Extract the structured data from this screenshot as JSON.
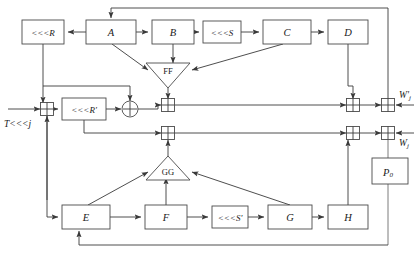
{
  "diagram": {
    "type": "block-diagram",
    "width": 420,
    "height": 255,
    "background_color": "#ffffff",
    "line_color": "#3a3a3a",
    "box_fill": "#ffffff",
    "box_stroke": "#4a4a4a",
    "text_color": "#1a1a1a"
  },
  "boxes": {
    "rot_r": {
      "label": "<<<R",
      "x": 22,
      "y": 20,
      "w": 42,
      "h": 24
    },
    "a": {
      "label": "A",
      "x": 86,
      "y": 20,
      "w": 50,
      "h": 24
    },
    "b": {
      "label": "B",
      "x": 152,
      "y": 20,
      "w": 42,
      "h": 24
    },
    "rot_s": {
      "label": "<<<S",
      "x": 203,
      "y": 20,
      "w": 38,
      "h": 22
    },
    "c": {
      "label": "C",
      "x": 263,
      "y": 20,
      "w": 48,
      "h": 24
    },
    "d": {
      "label": "D",
      "x": 328,
      "y": 20,
      "w": 40,
      "h": 24
    },
    "rot_rp": {
      "label": "<<<R'",
      "x": 62,
      "y": 98,
      "w": 44,
      "h": 22
    },
    "e": {
      "label": "E",
      "x": 62,
      "y": 205,
      "w": 48,
      "h": 24
    },
    "f": {
      "label": "F",
      "x": 145,
      "y": 205,
      "w": 42,
      "h": 24
    },
    "rot_sp": {
      "label": "<<<S'",
      "x": 212,
      "y": 206,
      "w": 36,
      "h": 22
    },
    "g": {
      "label": "G",
      "x": 268,
      "y": 205,
      "w": 44,
      "h": 24
    },
    "h": {
      "label": "H",
      "x": 328,
      "y": 205,
      "w": 40,
      "h": 24
    },
    "p0": {
      "label": "P",
      "sublabel": "0",
      "x": 372,
      "y": 158,
      "w": 36,
      "h": 26
    }
  },
  "triangles": {
    "ff": {
      "label": "FF",
      "cx": 168,
      "cy": 74,
      "half_width": 22,
      "height": 24,
      "orientation": "down"
    },
    "gg": {
      "label": "GG",
      "cx": 168,
      "cy": 168,
      "half_width": 22,
      "height": 24,
      "orientation": "up"
    }
  },
  "xor_boxes": [
    {
      "name": "xor-input",
      "cx": 47,
      "cy": 109,
      "size": 13
    },
    {
      "name": "xor-upper-mid",
      "cx": 168,
      "cy": 105,
      "size": 13
    },
    {
      "name": "xor-lower-mid",
      "cx": 168,
      "cy": 133,
      "size": 13
    },
    {
      "name": "xor-upper-right-inner",
      "cx": 353,
      "cy": 105,
      "size": 13
    },
    {
      "name": "xor-upper-right-outer",
      "cx": 388,
      "cy": 105,
      "size": 13
    },
    {
      "name": "xor-lower-right-inner",
      "cx": 353,
      "cy": 133,
      "size": 13
    },
    {
      "name": "xor-lower-right-outer",
      "cx": 388,
      "cy": 133,
      "size": 13
    }
  ],
  "circle_xor": {
    "name": "circle-xor-plus",
    "cx": 130,
    "cy": 109,
    "r": 8
  },
  "io": {
    "input_label": "T<<<j",
    "input_label_x": 4,
    "input_label_y": 124,
    "output_top_label": "W'",
    "output_top_sub": "j",
    "output_top_x": 401,
    "output_top_y": 95,
    "output_bottom_label": "W",
    "output_bottom_sub": "j",
    "output_bottom_x": 401,
    "output_bottom_y": 143
  },
  "annotations": {
    "top_feedback_y": 8,
    "bottom_feedback_y": 245,
    "right_bus_x": 388
  }
}
